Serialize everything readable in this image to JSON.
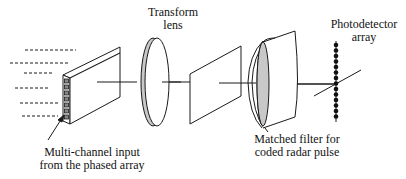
{
  "diagram": {
    "colors": {
      "stroke": "#1a1a1a",
      "lens_fill": "#c8c8c8",
      "background": "#ffffff"
    },
    "labels": {
      "input": {
        "line1": "Multi-channel input",
        "line2": "from the phased array"
      },
      "lens": {
        "line1": "Transform",
        "line2": "lens"
      },
      "filter": {
        "line1": "Matched filter for",
        "line2": "coded radar pulse"
      },
      "detector": {
        "line1": "Photodetector",
        "line2": "array"
      }
    },
    "components": [
      {
        "id": "input-modulator",
        "name": "Multi-channel input block",
        "channels": 7
      },
      {
        "id": "transform-lens",
        "name": "Transform lens"
      },
      {
        "id": "fourier-plane",
        "name": "Intermediate plane"
      },
      {
        "id": "matched-filter",
        "name": "Matched filter with lens"
      },
      {
        "id": "photodetector-array",
        "name": "Photodetector array",
        "elements": 15
      }
    ],
    "incoming_beams": 6
  }
}
